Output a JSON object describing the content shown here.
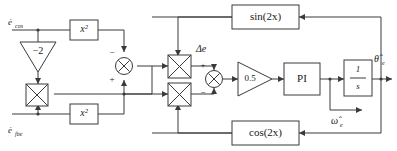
{
  "diagram": {
    "type": "control-block-diagram",
    "colors": {
      "line": "#3a3a3a",
      "block_fill": "#ffffff",
      "text": "#1a1a1a",
      "background": "#ffffff"
    },
    "inputs": [
      {
        "id": "e_cos_dot",
        "label": "ė",
        "subscript": "cos",
        "position": "top-left"
      },
      {
        "id": "e_fbe_dot",
        "label": "ė",
        "subscript": "fbe",
        "position": "bottom-left"
      }
    ],
    "outputs": [
      {
        "id": "theta_hat_e",
        "label": "θ̂",
        "subscript": "e",
        "position": "right-top"
      },
      {
        "id": "omega_hat_e",
        "label": "ω̂",
        "subscript": "e",
        "position": "right-bottom"
      }
    ],
    "blocks": [
      {
        "id": "square-top",
        "label": "x²",
        "shape": "rect",
        "name": "square-block-top"
      },
      {
        "id": "square-bottom",
        "label": "x²",
        "shape": "rect",
        "name": "square-block-bottom"
      },
      {
        "id": "gain-minus2",
        "label": "−2",
        "shape": "triangle",
        "name": "gain-minus-two"
      },
      {
        "id": "gain-half",
        "label": "0.5",
        "shape": "triangle",
        "name": "gain-zero-point-five"
      },
      {
        "id": "pi",
        "label": "PI",
        "shape": "rect",
        "name": "pi-controller"
      },
      {
        "id": "integrator",
        "label": "1/s",
        "numerator": "1",
        "denominator": "s",
        "shape": "rect",
        "name": "integrator-block"
      },
      {
        "id": "sin2x",
        "label": "sin(2x)",
        "shape": "rect",
        "name": "sin-two-x-block"
      },
      {
        "id": "cos2x",
        "label": "cos(2x)",
        "shape": "rect",
        "name": "cos-two-x-block"
      }
    ],
    "multipliers": [
      {
        "id": "mult-left",
        "name": "multiplier-left"
      },
      {
        "id": "mult-mid-top",
        "name": "multiplier-mid-top"
      },
      {
        "id": "mult-mid-bottom",
        "name": "multiplier-mid-bottom"
      }
    ],
    "summers": [
      {
        "id": "sum-left",
        "name": "summing-junction-left",
        "signs": [
          "−",
          "+"
        ]
      },
      {
        "id": "sum-right",
        "name": "summing-junction-right",
        "signs": [
          "+",
          "−"
        ]
      }
    ],
    "annotations": [
      {
        "id": "delta-e",
        "label": "Δe",
        "name": "delta-e-label"
      }
    ],
    "signs": {
      "minus": "−",
      "plus": "+"
    }
  }
}
